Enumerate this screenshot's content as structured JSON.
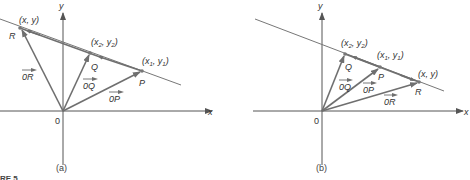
{
  "figure": {
    "panels": [
      {
        "id": "a",
        "caption": "(a)",
        "origin_label": "0",
        "x_axis_label": "x",
        "y_axis_label": "y",
        "points": [
          {
            "name": "R",
            "coord_label": "(x, y)"
          },
          {
            "name": "Q",
            "coord_label_main": "(x",
            "sub1": "2",
            "mid": ", y",
            "sub2": "2",
            "end": ")"
          },
          {
            "name": "P",
            "coord_label_main": "(x",
            "sub1": "1",
            "mid": ", y",
            "sub2": "1",
            "end": ")"
          }
        ],
        "vectors": [
          {
            "label": "0R"
          },
          {
            "label": "0Q"
          },
          {
            "label": "0P"
          }
        ]
      },
      {
        "id": "b",
        "caption": "(b)",
        "origin_label": "0",
        "x_axis_label": "x",
        "y_axis_label": "y",
        "points": [
          {
            "name": "Q",
            "coord_label_main": "(x",
            "sub1": "2",
            "mid": ", y",
            "sub2": "2",
            "end": ")"
          },
          {
            "name": "P",
            "coord_label_main": "(x",
            "sub1": "1",
            "mid": ", y",
            "sub2": "1",
            "end": ")"
          },
          {
            "name": "R",
            "coord_label": "(x, y)"
          }
        ],
        "vectors": [
          {
            "label": "0Q"
          },
          {
            "label": "0P"
          },
          {
            "label": "0R"
          }
        ]
      }
    ],
    "figure_label_fragment": "RE 5"
  }
}
